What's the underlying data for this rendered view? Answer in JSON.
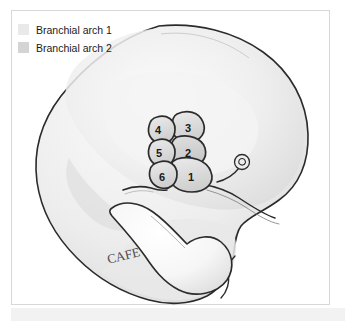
{
  "figure": {
    "background_color": "#ffffff",
    "frame_color": "#d8d8d8",
    "outline_color": "#2b2b2b"
  },
  "legend": {
    "position": "top-left",
    "items": [
      {
        "label": "Branchial arch 1",
        "color": "#e9e9e9",
        "swatch_name": "legend-swatch-arch-1"
      },
      {
        "label": "Branchial arch 2",
        "color": "#d4d4d4",
        "swatch_name": "legend-swatch-arch-2"
      }
    ]
  },
  "illustration": {
    "style": "pencil-shaded line drawing",
    "body_fill": "#f0f0f0",
    "head_fill": "#ececec",
    "shadow_fill": "#dedede",
    "structures": [
      {
        "name": "head",
        "label": ""
      },
      {
        "name": "heart-bulge",
        "label": ""
      },
      {
        "name": "otic-placode",
        "label": ""
      },
      {
        "name": "trunk",
        "label": ""
      }
    ],
    "arches": [
      {
        "number": "1",
        "name": "branchial-arch-1",
        "fill": "#e9e9e9",
        "cx": 182,
        "cy": 160
      },
      {
        "number": "2",
        "name": "branchial-arch-2",
        "fill": "#d9d9d9",
        "cx": 178,
        "cy": 137
      },
      {
        "number": "3",
        "name": "branchial-arch-3",
        "fill": "#dcdcdc",
        "cx": 175,
        "cy": 115
      },
      {
        "number": "4",
        "name": "branchial-arch-4",
        "fill": "#dcdcdc",
        "cx": 155,
        "cy": 119
      },
      {
        "number": "5",
        "name": "branchial-arch-5",
        "fill": "#dcdcdc",
        "cx": 155,
        "cy": 141
      },
      {
        "number": "6",
        "name": "branchial-arch-6",
        "fill": "#dcdcdc",
        "cx": 157,
        "cy": 163
      }
    ],
    "signature": "CAFE"
  }
}
